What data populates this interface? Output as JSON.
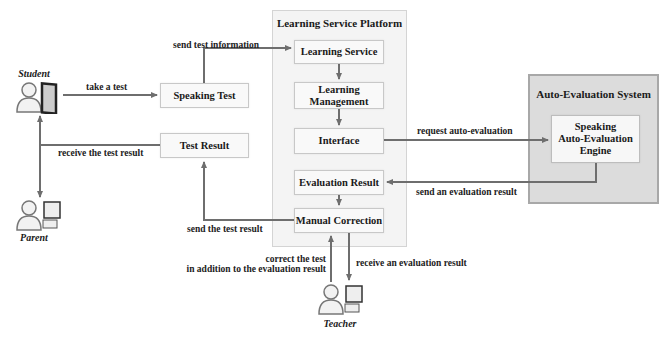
{
  "actors": {
    "student": "Student",
    "parent": "Parent",
    "teacher": "Teacher"
  },
  "containers": {
    "platform": "Learning Service  Platform",
    "auto_eval": "Auto-Evaluation System"
  },
  "boxes": {
    "speaking_test": "Speaking Test",
    "test_result": "Test Result",
    "learning_service": "Learning Service",
    "learning_management": "Learning Management",
    "interface": "Interface",
    "evaluation_result": "Evaluation Result",
    "manual_correction": "Manual Correction",
    "engine_line1": "Speaking",
    "engine_line2": "Auto-Evaluation",
    "engine_line3": "Engine"
  },
  "edges": {
    "take_test": "take a test",
    "send_test_info": "send test information",
    "receive_test_result": "receive the test result",
    "request_auto_eval": "request  auto-evaluation",
    "send_eval_result": "send an evaluation result",
    "send_test_result": "send the test result",
    "correct_test_line1": "correct the test",
    "correct_test_line2": "in addition to the evaluation result",
    "receive_eval_result": "receive an evaluation result"
  },
  "colors": {
    "line": "#6e6e6e",
    "container_bg": "#f4f4f4",
    "system_bg": "#dcdcdc",
    "box_bg": "#f9f9f9"
  }
}
